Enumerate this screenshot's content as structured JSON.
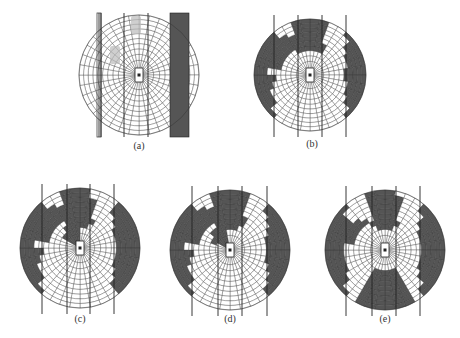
{
  "colors": {
    "occupied": "#555555",
    "grid": "#333333",
    "background": "#ffffff",
    "lane": "#222222",
    "vehicle": "#bbbbbb"
  },
  "grid": {
    "rings": 10,
    "sectors": 36
  },
  "panels": [
    {
      "id": "a",
      "label": "(a)",
      "cx": 139,
      "cy": 75,
      "r": 60,
      "label_x": 139,
      "label_y": 148,
      "lanes": [
        99,
        101,
        124,
        148
      ],
      "occupied_blocks": "none",
      "has_obstacles": true
    },
    {
      "id": "b",
      "label": "(b)",
      "cx": 310,
      "cy": 75,
      "r": 56,
      "label_x": 312,
      "label_y": 145,
      "lanes": [
        274,
        298,
        322,
        346
      ]
    },
    {
      "id": "c",
      "label": "(c)",
      "cx": 80,
      "cy": 248,
      "r": 60,
      "label_x": 80,
      "label_y": 320,
      "lanes": [
        42,
        67,
        90,
        114
      ]
    },
    {
      "id": "d",
      "label": "(d)",
      "cx": 230,
      "cy": 250,
      "r": 60,
      "label_x": 230,
      "label_y": 320,
      "lanes": [
        192,
        218,
        242,
        267
      ]
    },
    {
      "id": "e",
      "label": "(e)",
      "cx": 385,
      "cy": 250,
      "r": 60,
      "label_x": 385,
      "label_y": 320,
      "lanes": [
        346,
        372,
        396,
        420
      ]
    }
  ]
}
